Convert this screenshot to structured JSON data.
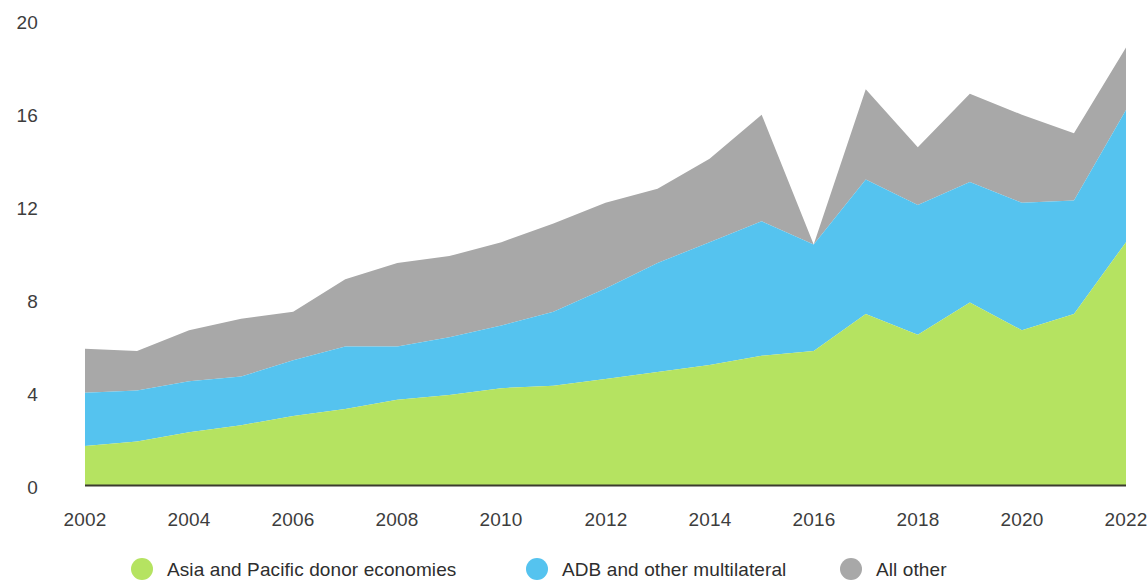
{
  "chart_data": {
    "type": "area",
    "stacked": true,
    "title": "",
    "subtitle": "",
    "xlabel": "",
    "ylabel": "",
    "grid": false,
    "legend_position": "bottom",
    "xlim": [
      2002,
      2022
    ],
    "ylim": [
      0,
      20
    ],
    "x": [
      2002,
      2003,
      2004,
      2005,
      2006,
      2007,
      2008,
      2009,
      2010,
      2011,
      2012,
      2013,
      2014,
      2015,
      2016,
      2017,
      2018,
      2019,
      2020,
      2021,
      2022
    ],
    "xticks": [
      2002,
      2004,
      2006,
      2008,
      2010,
      2012,
      2014,
      2016,
      2018,
      2020,
      2022
    ],
    "xtick_labels": [
      "2002",
      "2004",
      "2006",
      "2008",
      "2010",
      "2012",
      "2014",
      "2016",
      "2018",
      "2020",
      "2022"
    ],
    "yticks": [
      0,
      4,
      8,
      12,
      16,
      20
    ],
    "ytick_labels": [
      "0",
      "4",
      "8",
      "12",
      "16",
      "20"
    ],
    "series": [
      {
        "name": "Asia and Pacific donor economies",
        "color": "#b5e361",
        "values": [
          1.7,
          1.9,
          2.3,
          2.6,
          3.0,
          3.3,
          3.7,
          3.9,
          4.2,
          4.3,
          4.6,
          4.9,
          5.2,
          5.6,
          5.8,
          7.4,
          6.5,
          7.9,
          6.7,
          7.4,
          10.5
        ]
      },
      {
        "name": "ADB and other multilateral",
        "color": "#55c3ef",
        "values": [
          2.3,
          2.2,
          2.2,
          2.1,
          2.4,
          2.7,
          2.3,
          2.5,
          2.7,
          3.2,
          3.9,
          4.7,
          5.3,
          5.8,
          4.6,
          5.8,
          5.6,
          5.2,
          5.5,
          4.9,
          5.7
        ]
      },
      {
        "name": "All other",
        "color": "#a8a8a8",
        "values": [
          1.9,
          1.7,
          2.2,
          2.5,
          2.1,
          2.9,
          3.6,
          3.5,
          3.6,
          3.8,
          3.7,
          3.2,
          3.6,
          4.6,
          0.0,
          3.9,
          2.5,
          3.8,
          3.8,
          2.9,
          2.7
        ]
      }
    ],
    "totals": [
      5.9,
      5.8,
      6.7,
      7.2,
      7.5,
      8.9,
      9.6,
      9.9,
      10.5,
      11.3,
      12.2,
      12.8,
      14.1,
      16.0,
      10.4,
      17.1,
      14.6,
      16.9,
      16.0,
      15.2,
      18.9
    ]
  },
  "axes": {
    "y_ticks": [
      "20",
      "16",
      "12",
      "8",
      "4",
      "0"
    ],
    "x_ticks": [
      "2002",
      "2004",
      "2006",
      "2008",
      "2010",
      "2012",
      "2014",
      "2016",
      "2018",
      "2020",
      "2022"
    ]
  },
  "legend": {
    "items": [
      {
        "label": "Asia and Pacific donor economies",
        "color": "#b5e361"
      },
      {
        "label": "ADB and other multilateral",
        "color": "#55c3ef"
      },
      {
        "label": "All other",
        "color": "#a8a8a8"
      }
    ]
  }
}
